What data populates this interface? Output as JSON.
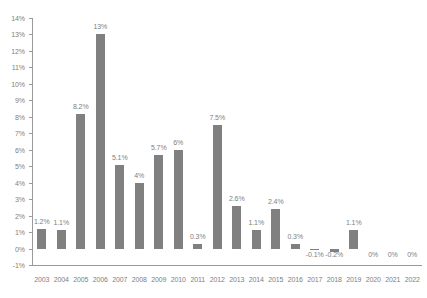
{
  "chart_data": {
    "type": "bar",
    "title": "",
    "subtitle": "",
    "xlabel": "",
    "ylabel": "",
    "categories": [
      "2003",
      "2004",
      "2005",
      "2006",
      "2007",
      "2008",
      "2009",
      "2010",
      "2011",
      "2012",
      "2013",
      "2014",
      "2015",
      "2016",
      "2017",
      "2018",
      "2019",
      "2020",
      "2021",
      "2022"
    ],
    "values": [
      1.2,
      1.1,
      8.2,
      13.0,
      5.1,
      4.0,
      5.7,
      6.0,
      0.3,
      7.5,
      2.6,
      1.1,
      2.4,
      0.3,
      -0.1,
      -0.2,
      1.1,
      0.0,
      0.0,
      0.0
    ],
    "data_labels": [
      "1.2%",
      "1.1%",
      "8.2%",
      "13%",
      "5.1%",
      "4%",
      "5.7%",
      "6%",
      "0.3%",
      "7.5%",
      "2.6%",
      "1.1%",
      "2.4%",
      "0.3%",
      "-0.1%",
      "-0.2%",
      "1.1%",
      "0%",
      "0%",
      "0%"
    ],
    "ylim": [
      -1,
      14
    ],
    "ytick_values": [
      -1,
      0,
      1,
      2,
      3,
      4,
      5,
      6,
      7,
      8,
      9,
      10,
      11,
      12,
      13,
      14
    ],
    "ytick_labels": [
      "-1%",
      "0%",
      "1%",
      "2%",
      "3%",
      "4%",
      "5%",
      "6%",
      "7%",
      "8%",
      "9%",
      "10%",
      "11%",
      "12%",
      "13%",
      "14%"
    ],
    "grid": false,
    "legend": false,
    "legend_position": "none",
    "series": [
      {
        "name": "",
        "values": [
          1.2,
          1.1,
          8.2,
          13.0,
          5.1,
          4.0,
          5.7,
          6.0,
          0.3,
          7.5,
          2.6,
          1.1,
          2.4,
          0.3,
          -0.1,
          -0.2,
          1.1,
          0.0,
          0.0,
          0.0
        ]
      }
    ],
    "colors": {
      "bar": "#808080",
      "axis": "#9a9a9a",
      "text": "#808080",
      "background": "#ffffff"
    }
  }
}
